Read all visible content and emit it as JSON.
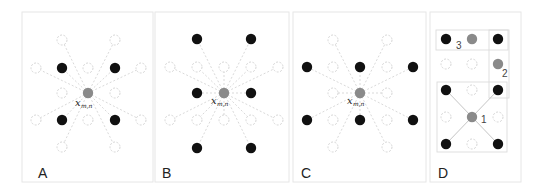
{
  "figure": {
    "colors": {
      "black_dot": "#111111",
      "gray_dot": "#8a8a8a",
      "open_dot_stroke": "#d6d6d6",
      "dashed_line": "#cfcfcf",
      "panel_border": "#e6e6e6",
      "rect_border": "#dcdcdc"
    },
    "panels": [
      {
        "id": "A",
        "label": "A",
        "center_label": "x",
        "center_subscript": "m,n",
        "center": [
          88,
          93
        ],
        "black": [
          [
            62,
            68
          ],
          [
            115,
            68
          ],
          [
            62,
            120
          ],
          [
            115,
            120
          ]
        ],
        "open": [
          [
            62,
            40
          ],
          [
            115,
            40
          ],
          [
            36,
            68
          ],
          [
            88,
            68
          ],
          [
            141,
            68
          ],
          [
            62,
            93
          ],
          [
            115,
            93
          ],
          [
            36,
            120
          ],
          [
            88,
            120
          ],
          [
            141,
            120
          ],
          [
            62,
            147
          ],
          [
            115,
            147
          ]
        ]
      },
      {
        "id": "B",
        "label": "B",
        "center_label": "x",
        "center_subscript": "m,n",
        "center": [
          224,
          93
        ],
        "black": [
          [
            197,
            39
          ],
          [
            251,
            39
          ],
          [
            197,
            93
          ],
          [
            251,
            93
          ],
          [
            197,
            148
          ],
          [
            251,
            148
          ]
        ],
        "open": [
          [
            170,
            67
          ],
          [
            197,
            67
          ],
          [
            224,
            67
          ],
          [
            251,
            67
          ],
          [
            278,
            67
          ],
          [
            170,
            120
          ],
          [
            197,
            120
          ],
          [
            224,
            120
          ],
          [
            251,
            120
          ],
          [
            278,
            120
          ]
        ]
      },
      {
        "id": "C",
        "label": "C",
        "center_label": "x",
        "center_subscript": "m,n",
        "center": [
          360,
          93
        ],
        "black": [
          [
            307,
            67
          ],
          [
            360,
            67
          ],
          [
            413,
            67
          ],
          [
            307,
            120
          ],
          [
            360,
            120
          ],
          [
            413,
            120
          ]
        ],
        "open": [
          [
            333,
            40
          ],
          [
            387,
            40
          ],
          [
            333,
            67
          ],
          [
            387,
            67
          ],
          [
            333,
            93
          ],
          [
            387,
            93
          ],
          [
            333,
            120
          ],
          [
            387,
            120
          ],
          [
            333,
            147
          ],
          [
            387,
            147
          ]
        ]
      },
      {
        "id": "D",
        "label": "D",
        "black": [
          [
            446,
            39
          ],
          [
            498,
            39
          ],
          [
            446,
            90
          ],
          [
            498,
            90
          ],
          [
            446,
            144
          ],
          [
            498,
            144
          ]
        ],
        "gray": [
          [
            472,
            39
          ],
          [
            498,
            64
          ],
          [
            472,
            117
          ]
        ],
        "open": [
          [
            446,
            64
          ],
          [
            472,
            64
          ],
          [
            472,
            90
          ],
          [
            446,
            117
          ],
          [
            498,
            117
          ],
          [
            472,
            144
          ]
        ],
        "numbers": [
          {
            "text": "1",
            "pos": [
              481,
              122
            ]
          },
          {
            "text": "2",
            "pos": [
              503,
              77
            ]
          },
          {
            "text": "3",
            "pos": [
              457,
              48
            ]
          }
        ]
      }
    ]
  }
}
